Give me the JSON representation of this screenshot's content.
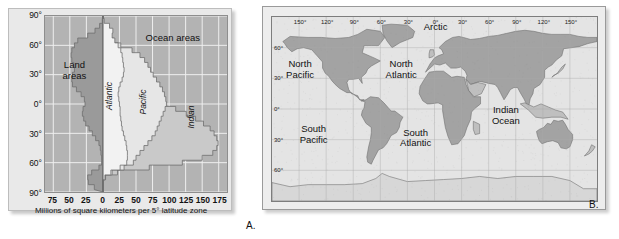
{
  "figure": {
    "panel_a_label": "A.",
    "panel_b_label": "B."
  },
  "chart_data": {
    "type": "area",
    "title": "",
    "xlabel": "Millions of square kilometers per 5° latitude zone",
    "ylabel": "",
    "xlim": [
      -87.5,
      187.5
    ],
    "ylim": [
      -90,
      90
    ],
    "grid": true,
    "legend": "inline-annotations",
    "xticks": [
      "75",
      "50",
      "25",
      "0",
      "25",
      "50",
      "75",
      "100",
      "125",
      "150",
      "175"
    ],
    "xtick_values": [
      -75,
      -50,
      -25,
      0,
      25,
      50,
      75,
      100,
      125,
      150,
      175
    ],
    "yticks": [
      "90°",
      "60°",
      "30°",
      "0°",
      "30°",
      "60°",
      "90°"
    ],
    "ytick_values": [
      90,
      60,
      30,
      0,
      -30,
      -60,
      -90
    ],
    "annotations": [
      {
        "text": "Land\nareas",
        "x": -42,
        "y": 34,
        "rotation": 0,
        "style": "normal"
      },
      {
        "text": "Ocean areas",
        "x": 105,
        "y": 67,
        "rotation": 0,
        "style": "normal"
      },
      {
        "text": "Atlantic",
        "x": 11,
        "y": 8,
        "rotation": -90,
        "style": "italic"
      },
      {
        "text": "Pacific",
        "x": 62,
        "y": 2,
        "rotation": -90,
        "style": "italic"
      },
      {
        "text": "Indian",
        "x": 134,
        "y": -13,
        "rotation": -90,
        "style": "italic"
      }
    ],
    "series": [
      {
        "name": "Land areas",
        "color": "#9a9a9a",
        "direction": "negative",
        "latitudes": [
          90,
          85,
          80,
          75,
          70,
          65,
          60,
          55,
          50,
          45,
          40,
          35,
          30,
          25,
          20,
          15,
          10,
          5,
          0,
          -5,
          -10,
          -15,
          -20,
          -25,
          -30,
          -35,
          -40,
          -45,
          -50,
          -55,
          -60,
          -65,
          -70,
          -75,
          -80,
          -85
        ],
        "values": [
          0,
          1,
          5,
          12,
          23,
          38,
          43,
          47,
          48,
          47,
          44,
          43,
          46,
          47,
          46,
          40,
          33,
          28,
          27,
          30,
          31,
          29,
          26,
          21,
          16,
          11,
          6,
          4,
          3,
          2,
          2,
          6,
          17,
          23,
          22,
          13
        ]
      },
      {
        "name": "Atlantic",
        "color": "#f2f2f2",
        "direction": "positive",
        "latitudes": [
          90,
          85,
          80,
          75,
          70,
          65,
          60,
          55,
          50,
          45,
          40,
          35,
          30,
          25,
          20,
          15,
          10,
          5,
          0,
          -5,
          -10,
          -15,
          -20,
          -25,
          -30,
          -35,
          -40,
          -45,
          -50,
          -55,
          -60,
          -65,
          -70,
          -75,
          -80,
          -85
        ],
        "values": [
          0,
          2,
          10,
          15,
          14,
          18,
          23,
          27,
          29,
          30,
          31,
          32,
          31,
          29,
          26,
          24,
          23,
          24,
          25,
          26,
          26,
          27,
          28,
          29,
          31,
          33,
          35,
          36,
          37,
          37,
          36,
          26,
          12,
          3,
          0,
          0
        ]
      },
      {
        "name": "Pacific",
        "color": "#e6e6e6",
        "direction": "positive-stacked",
        "latitudes": [
          90,
          85,
          80,
          75,
          70,
          65,
          60,
          55,
          50,
          45,
          40,
          35,
          30,
          25,
          20,
          15,
          10,
          5,
          0,
          -5,
          -10,
          -15,
          -20,
          -25,
          -30,
          -35,
          -40,
          -45,
          -50,
          -55,
          -60,
          -65,
          -70,
          -75,
          -80,
          -85
        ],
        "values": [
          0,
          0,
          0,
          2,
          8,
          16,
          27,
          44,
          56,
          63,
          68,
          72,
          76,
          81,
          86,
          90,
          93,
          95,
          96,
          94,
          91,
          88,
          85,
          82,
          79,
          74,
          68,
          62,
          56,
          50,
          46,
          32,
          14,
          3,
          0,
          0
        ]
      },
      {
        "name": "Indian",
        "color": "#c9c9c9",
        "direction": "positive-stacked",
        "latitudes": [
          90,
          85,
          80,
          75,
          70,
          65,
          60,
          55,
          50,
          45,
          40,
          35,
          30,
          25,
          20,
          15,
          10,
          5,
          0,
          -5,
          -10,
          -15,
          -20,
          -25,
          -30,
          -35,
          -40,
          -45,
          -50,
          -55,
          -60,
          -65,
          -70,
          -75,
          -80,
          -85
        ],
        "values": [
          0,
          0,
          0,
          0,
          0,
          0,
          0,
          0,
          0,
          0,
          0,
          0,
          0,
          2,
          14,
          34,
          55,
          74,
          93,
          110,
          126,
          140,
          152,
          162,
          168,
          172,
          174,
          172,
          166,
          150,
          120,
          70,
          22,
          4,
          0,
          0
        ]
      }
    ]
  },
  "map": {
    "projection": "world-equirectangular",
    "lon_ticks": [
      {
        "label": "150°",
        "value": -150
      },
      {
        "label": "120°",
        "value": -120
      },
      {
        "label": "90°",
        "value": -90
      },
      {
        "label": "60°",
        "value": -60
      },
      {
        "label": "30°",
        "value": -30
      },
      {
        "label": "0°",
        "value": 0
      },
      {
        "label": "30°",
        "value": 30
      },
      {
        "label": "60°",
        "value": 60
      },
      {
        "label": "90°",
        "value": 90
      },
      {
        "label": "120°",
        "value": 120
      },
      {
        "label": "150°",
        "value": 150
      }
    ],
    "lat_ticks": [
      {
        "label": "60°",
        "value": 60
      },
      {
        "label": "30°",
        "value": 30
      },
      {
        "label": "0°",
        "value": 0
      },
      {
        "label": "30°",
        "value": -30
      },
      {
        "label": "60°",
        "value": -60
      }
    ],
    "ocean_labels": [
      {
        "text": "Arctic",
        "lon": 0,
        "lat": 78
      },
      {
        "text": "North\nPacific",
        "lon": -150,
        "lat": 42
      },
      {
        "text": "North\nAtlantic",
        "lon": -38,
        "lat": 42
      },
      {
        "text": "South\nPacific",
        "lon": -135,
        "lat": -22
      },
      {
        "text": "South\nAtlantic",
        "lon": -22,
        "lat": -25
      },
      {
        "text": "Indian\nOcean",
        "lon": 78,
        "lat": -3
      }
    ],
    "colors": {
      "ocean": "#e4e4e4",
      "land": "#9d9d9d",
      "land_light": "#bcbcbc",
      "grid": "#a8a8a8",
      "frame": "#7d7d7d"
    }
  }
}
